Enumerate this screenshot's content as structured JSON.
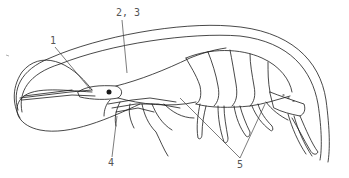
{
  "figure": {
    "labels": [
      {
        "id": "1",
        "text": "1",
        "x": 50,
        "y": 38
      },
      {
        "id": "2-3",
        "text": "2, 3",
        "x": 116,
        "y": 8
      },
      {
        "id": "4",
        "text": "4",
        "x": 108,
        "y": 158
      },
      {
        "id": "5",
        "text": "5",
        "x": 238,
        "y": 158
      }
    ],
    "colors": {
      "line": "#1a1a1a",
      "leader": "#444444",
      "label": "#555555",
      "background": "#ffffff"
    }
  }
}
